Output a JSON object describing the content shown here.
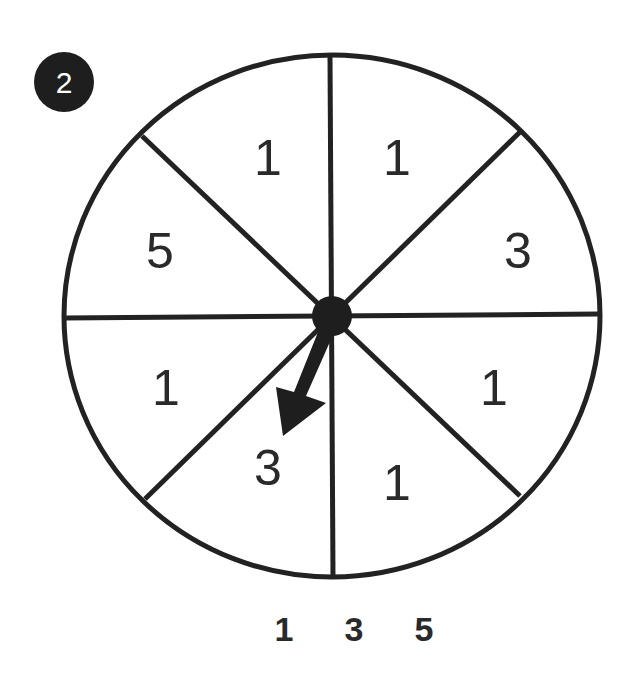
{
  "problem": {
    "number": "2",
    "badge_color": "#1e1e1e"
  },
  "spinner": {
    "stroke_color": "#222222",
    "sections": [
      {
        "position": "top-left",
        "value": "1"
      },
      {
        "position": "top-right",
        "value": "1"
      },
      {
        "position": "right-upper",
        "value": "3"
      },
      {
        "position": "right-lower",
        "value": "1"
      },
      {
        "position": "bottom-right",
        "value": "1"
      },
      {
        "position": "bottom-left",
        "value": "3"
      },
      {
        "position": "left-lower",
        "value": "1"
      },
      {
        "position": "left-upper",
        "value": "5"
      }
    ],
    "arrow_pointing_to": "3"
  },
  "answer_choices": [
    "1",
    "3",
    "5"
  ]
}
